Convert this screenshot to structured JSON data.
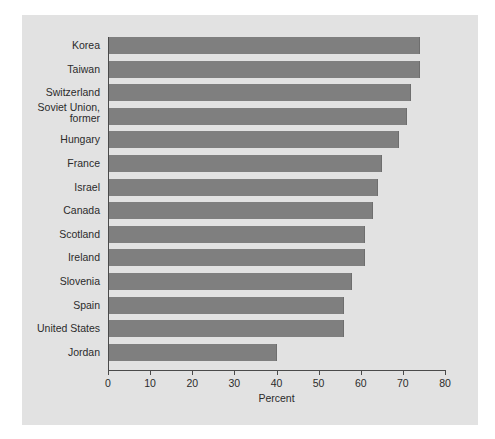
{
  "chart_data": {
    "type": "bar",
    "orientation": "horizontal",
    "title": "",
    "xlabel": "Percent",
    "ylabel": "",
    "xlim": [
      0,
      80
    ],
    "xticks": [
      0,
      10,
      20,
      30,
      40,
      50,
      60,
      70,
      80
    ],
    "grid": false,
    "legend": null,
    "bar_color": "#7f7f7f",
    "panel_color": "#e2e2e2",
    "categories": [
      "Korea",
      "Taiwan",
      "Switzerland",
      "Soviet Union,\nformer",
      "Hungary",
      "France",
      "Israel",
      "Canada",
      "Scotland",
      "Ireland",
      "Slovenia",
      "Spain",
      "United States",
      "Jordan"
    ],
    "values": [
      74,
      74,
      72,
      71,
      69,
      65,
      64,
      63,
      61,
      61,
      58,
      56,
      56,
      40
    ]
  }
}
